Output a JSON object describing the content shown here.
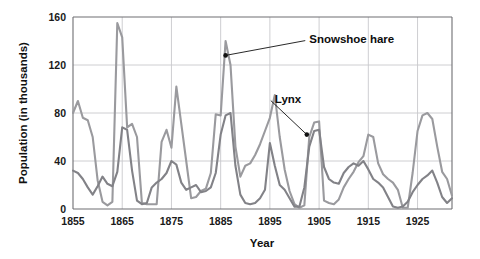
{
  "figure": {
    "background_color": "#ffffff",
    "plot_background_color": "#ffffff"
  },
  "chart_data": {
    "type": "line",
    "title": "",
    "subtitle": "",
    "xlabel": "Year",
    "ylabel": "Population (in thousands)",
    "xlim": [
      1855,
      1932
    ],
    "ylim": [
      0,
      160
    ],
    "xticks": [
      1855,
      1865,
      1875,
      1885,
      1895,
      1905,
      1915,
      1925
    ],
    "xticklabels": [
      "1855",
      "1865",
      "1875",
      "1885",
      "1895",
      "1905",
      "1915",
      "1925"
    ],
    "yticks": [
      0,
      40,
      80,
      120,
      160
    ],
    "yticklabels": [
      "0",
      "40",
      "80",
      "120",
      "160"
    ],
    "grid": true,
    "grid_axis": "both",
    "legend_position": "none",
    "annotations": [
      {
        "text": "Snowshoe hare",
        "series": "Snowshoe hare",
        "point_x": 1886,
        "point_y": 128,
        "label_x": 1903,
        "label_y": 142
      },
      {
        "text": "Lynx",
        "series": "Lynx",
        "point_x": 1902.5,
        "point_y": 62,
        "label_x": 1896,
        "label_y": 92
      }
    ],
    "series": [
      {
        "name": "Snowshoe hare",
        "color": "#9a9a9e",
        "line_width": 2.1,
        "x": [
          1855,
          1856,
          1857,
          1858,
          1859,
          1860,
          1861,
          1862,
          1863,
          1864,
          1865,
          1866,
          1867,
          1868,
          1869,
          1870,
          1871,
          1872,
          1873,
          1874,
          1875,
          1876,
          1877,
          1878,
          1879,
          1880,
          1881,
          1882,
          1883,
          1884,
          1885,
          1886,
          1887,
          1888,
          1889,
          1890,
          1891,
          1892,
          1893,
          1894,
          1895,
          1896,
          1897,
          1898,
          1899,
          1900,
          1901,
          1902,
          1903,
          1904,
          1905,
          1906,
          1907,
          1908,
          1909,
          1910,
          1911,
          1912,
          1913,
          1914,
          1915,
          1916,
          1917,
          1918,
          1919,
          1920,
          1921,
          1922,
          1923,
          1924,
          1925,
          1926,
          1927,
          1928,
          1929,
          1930,
          1931,
          1932
        ],
        "y": [
          80,
          90,
          76,
          74,
          60,
          24,
          6,
          3,
          6,
          155,
          143,
          68,
          71,
          60,
          5,
          4,
          4,
          4,
          56,
          66,
          51,
          102,
          71,
          40,
          9,
          10,
          15,
          17,
          30,
          79,
          78,
          140,
          120,
          52,
          27,
          36,
          38,
          45,
          54,
          65,
          76,
          95,
          60,
          33,
          15,
          4,
          1,
          3,
          60,
          72,
          73,
          7,
          5,
          4,
          8,
          18,
          25,
          31,
          39,
          44,
          62,
          60,
          38,
          29,
          25,
          22,
          16,
          1,
          1,
          30,
          65,
          78,
          80,
          75,
          52,
          31,
          25,
          11
        ],
        "description": "Snowshoe hare population in thousands, Hudson's Bay Company pelt records, showing roughly 10-year boom-bust cycles with peaks of about 155 thousand near 1864, 140 thousand near 1886, and 80 thousand near 1927."
      },
      {
        "name": "Lynx",
        "color": "#828287",
        "line_width": 2.1,
        "x": [
          1855,
          1856,
          1857,
          1858,
          1859,
          1860,
          1861,
          1862,
          1863,
          1864,
          1865,
          1866,
          1867,
          1868,
          1869,
          1870,
          1871,
          1872,
          1873,
          1874,
          1875,
          1876,
          1877,
          1878,
          1879,
          1880,
          1881,
          1882,
          1883,
          1884,
          1885,
          1886,
          1887,
          1888,
          1889,
          1890,
          1891,
          1892,
          1893,
          1894,
          1895,
          1896,
          1897,
          1898,
          1899,
          1900,
          1901,
          1902,
          1903,
          1904,
          1905,
          1906,
          1907,
          1908,
          1909,
          1910,
          1911,
          1912,
          1913,
          1914,
          1915,
          1916,
          1917,
          1918,
          1919,
          1920,
          1921,
          1922,
          1923,
          1924,
          1925,
          1926,
          1927,
          1928,
          1929,
          1930,
          1931,
          1932
        ],
        "y": [
          32,
          30,
          25,
          18,
          12,
          19,
          27,
          21,
          19,
          31,
          68,
          66,
          32,
          7,
          4,
          5,
          18,
          22,
          25,
          30,
          40,
          37,
          22,
          16,
          18,
          20,
          14,
          15,
          18,
          30,
          62,
          78,
          80,
          36,
          12,
          5,
          4,
          5,
          9,
          16,
          55,
          36,
          20,
          16,
          9,
          2,
          2,
          18,
          52,
          65,
          66,
          35,
          25,
          22,
          21,
          30,
          35,
          38,
          36,
          40,
          33,
          25,
          22,
          18,
          10,
          2,
          1,
          2,
          6,
          14,
          20,
          25,
          28,
          32,
          22,
          10,
          5,
          9
        ],
        "description": "Canada lynx population in thousands, lagging the snowshoe hare cycle by roughly one to two years, with peaks of about 80 thousand near 1887 and 66 thousand near 1905."
      }
    ]
  }
}
